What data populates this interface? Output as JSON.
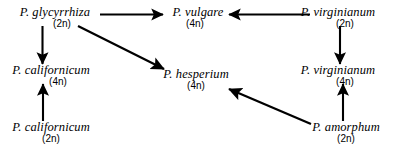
{
  "figure": {
    "type": "reticulate-evolution-diagram",
    "background_color": "#ffffff",
    "line_color": "#000000",
    "text_color": "#000000"
  },
  "nodes": [
    {
      "id": "glycyrrhiza",
      "species": "P. glycyrrhiza",
      "ploidy": "(2n)"
    },
    {
      "id": "vulgare",
      "species": "P. vulgare",
      "ploidy": "(4n)"
    },
    {
      "id": "virginianum_2n",
      "species": "P. virginianum",
      "ploidy": "(2n)"
    },
    {
      "id": "californicum_4n",
      "species": "P. californicum",
      "ploidy": "(4n)"
    },
    {
      "id": "hesperium",
      "species": "P. hesperium",
      "ploidy": "(4n)"
    },
    {
      "id": "virginianum_4n",
      "species": "P. virginianum",
      "ploidy": "(4n)"
    },
    {
      "id": "californicum_2n",
      "species": "P. californicum",
      "ploidy": "(2n)"
    },
    {
      "id": "amorphum",
      "species": "P. amorphum",
      "ploidy": "(2n)"
    }
  ],
  "edges": [
    {
      "id": "glycyrrhiza-to-vulgare",
      "from": "glycyrrhiza",
      "to": "vulgare"
    },
    {
      "id": "virginianum2n-to-vulgare",
      "from": "virginianum_2n",
      "to": "vulgare"
    },
    {
      "id": "glycyrrhiza-to-californicum4n",
      "from": "glycyrrhiza",
      "to": "californicum_4n"
    },
    {
      "id": "glycyrrhiza-to-hesperium",
      "from": "glycyrrhiza",
      "to": "hesperium"
    },
    {
      "id": "virginianum2n-to-virginianum4n",
      "from": "virginianum_2n",
      "to": "virginianum_4n"
    },
    {
      "id": "californicum2n-to-californicum4n",
      "from": "californicum_2n",
      "to": "californicum_4n"
    },
    {
      "id": "amorphum-to-virginianum4n",
      "from": "amorphum",
      "to": "virginianum_4n"
    },
    {
      "id": "amorphum-to-hesperium",
      "from": "amorphum",
      "to": "hesperium"
    }
  ]
}
